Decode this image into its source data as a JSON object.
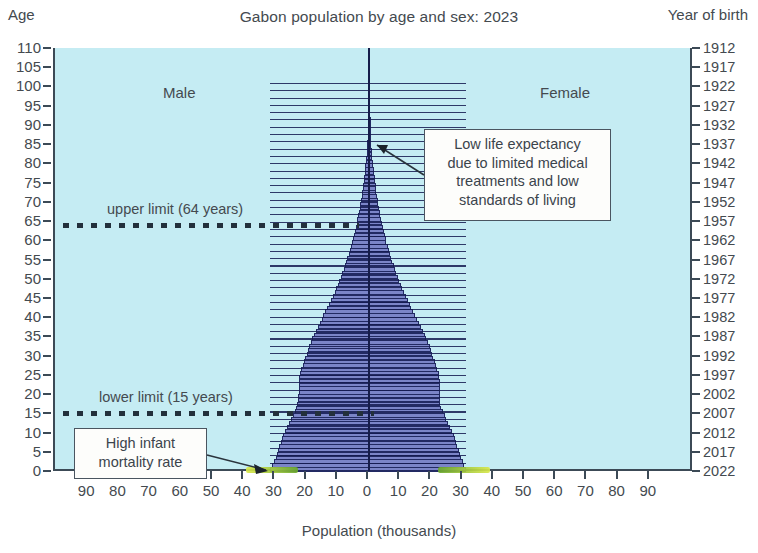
{
  "chart_data": {
    "type": "bar",
    "subtype": "population-pyramid",
    "title": "Gabon population by age and sex: 2023",
    "xlabel": "Population (thousands)",
    "ylabel": "Age",
    "ylabel_right": "Year of birth",
    "xlim": [
      -100,
      100
    ],
    "xtick_values": [
      -90,
      -80,
      -70,
      -60,
      -50,
      -40,
      -30,
      -20,
      -10,
      0,
      10,
      20,
      30,
      40,
      50,
      60,
      70,
      80,
      90
    ],
    "xtick_labels": [
      "90",
      "80",
      "70",
      "60",
      "50",
      "40",
      "30",
      "20",
      "10",
      "0",
      "10",
      "20",
      "30",
      "40",
      "50",
      "60",
      "70",
      "80",
      "90"
    ],
    "ylim": [
      0,
      110
    ],
    "ytick_labels": [
      "110",
      "105",
      "100",
      "95",
      "90",
      "85",
      "80",
      "75",
      "70",
      "65",
      "60",
      "55",
      "50",
      "45",
      "40",
      "35",
      "30",
      "25",
      "20",
      "15",
      "10",
      "5",
      "0"
    ],
    "year_of_birth_labels": [
      "1912",
      "1917",
      "1922",
      "1927",
      "1932",
      "1937",
      "1942",
      "1947",
      "1952",
      "1957",
      "1962",
      "1967",
      "1972",
      "1977",
      "1982",
      "1987",
      "1992",
      "1997",
      "2002",
      "2007",
      "2012",
      "2017",
      "2022"
    ],
    "grid": false,
    "legend": [
      "Male",
      "Female"
    ],
    "legend_position": "in-plot",
    "age_labels": [
      "0",
      "1",
      "2",
      "3",
      "4",
      "5",
      "6",
      "7",
      "8",
      "9",
      "10",
      "11",
      "12",
      "13",
      "14",
      "15",
      "16",
      "17",
      "18",
      "19",
      "20",
      "21",
      "22",
      "23",
      "24",
      "25",
      "26",
      "27",
      "28",
      "29",
      "30",
      "31",
      "32",
      "33",
      "34",
      "35",
      "36",
      "37",
      "38",
      "39",
      "40",
      "41",
      "42",
      "43",
      "44",
      "45",
      "46",
      "47",
      "48",
      "49",
      "50",
      "51",
      "52",
      "53",
      "54",
      "55",
      "56",
      "57",
      "58",
      "59",
      "60",
      "61",
      "62",
      "63",
      "64",
      "65",
      "66",
      "67",
      "68",
      "69",
      "70",
      "71",
      "72",
      "73",
      "74",
      "75",
      "76",
      "77",
      "78",
      "79",
      "80",
      "81",
      "82",
      "83",
      "84",
      "85",
      "86",
      "87",
      "88",
      "89",
      "90",
      "91",
      "92",
      "93",
      "94",
      "95",
      "96",
      "97",
      "98",
      "99",
      "100"
    ],
    "series": [
      {
        "name": "Male",
        "side": "left",
        "values": [
          31.8,
          31.0,
          30.4,
          29.9,
          29.5,
          29.1,
          28.7,
          28.3,
          27.9,
          27.5,
          27.0,
          26.3,
          25.6,
          25.0,
          24.4,
          23.8,
          23.4,
          23.0,
          22.8,
          22.6,
          22.5,
          22.5,
          22.5,
          22.5,
          22.4,
          22.2,
          21.8,
          21.3,
          20.8,
          20.4,
          20.0,
          19.6,
          19.2,
          18.7,
          18.2,
          17.6,
          17.0,
          16.4,
          15.8,
          15.2,
          14.6,
          14.0,
          13.4,
          12.8,
          12.2,
          11.6,
          11.0,
          10.5,
          10.0,
          9.5,
          9.0,
          8.5,
          8.1,
          7.7,
          7.3,
          6.9,
          6.5,
          6.1,
          5.8,
          5.4,
          5.1,
          4.8,
          4.5,
          4.2,
          3.9,
          3.7,
          3.4,
          3.2,
          3.0,
          2.8,
          2.6,
          2.4,
          2.2,
          2.0,
          1.9,
          1.7,
          1.6,
          1.4,
          1.3,
          1.2,
          1.0,
          0.9,
          0.8,
          0.7,
          0.6,
          0.5,
          0.4,
          0.35,
          0.3,
          0.25,
          0.2,
          0.16,
          0.13,
          0.1,
          0.08,
          0.06,
          0.05,
          0.04,
          0.03,
          0.02,
          0.02
        ]
      },
      {
        "name": "Female",
        "side": "right",
        "values": [
          31.2,
          30.5,
          30.0,
          29.5,
          29.1,
          28.7,
          28.3,
          27.9,
          27.5,
          27.1,
          26.6,
          26.0,
          25.4,
          24.8,
          24.2,
          23.6,
          23.2,
          22.9,
          22.7,
          22.6,
          22.6,
          22.6,
          22.6,
          22.6,
          22.5,
          22.3,
          21.9,
          21.4,
          21.0,
          20.6,
          20.2,
          19.8,
          19.4,
          18.9,
          18.4,
          17.8,
          17.2,
          16.6,
          16.0,
          15.4,
          14.8,
          14.2,
          13.6,
          13.0,
          12.4,
          11.8,
          11.2,
          10.7,
          10.2,
          9.7,
          9.2,
          8.7,
          8.3,
          7.9,
          7.5,
          7.1,
          6.7,
          6.3,
          6.0,
          5.6,
          5.3,
          5.0,
          4.7,
          4.4,
          4.1,
          3.9,
          3.6,
          3.4,
          3.2,
          3.0,
          2.8,
          2.6,
          2.4,
          2.2,
          2.1,
          1.9,
          1.8,
          1.6,
          1.5,
          1.4,
          1.2,
          1.1,
          1.0,
          0.9,
          0.8,
          0.7,
          0.55,
          0.45,
          0.38,
          0.3,
          0.25,
          0.2,
          0.16,
          0.13,
          0.1,
          0.08,
          0.06,
          0.05,
          0.04,
          0.03,
          0.02
        ]
      }
    ],
    "annotations": [
      {
        "id": "upper-limit",
        "label": "upper limit (64 years)",
        "age": 64,
        "style": "dotted-horizontal-line"
      },
      {
        "id": "lower-limit",
        "label": "lower limit (15 years)",
        "age": 15,
        "style": "dotted-horizontal-line"
      },
      {
        "id": "low-life-expectancy",
        "text": "Low life expectancy due to limited medical treatments and low standards of living",
        "lines": [
          "Low life expectancy",
          "due to limited medical",
          "treatments and low",
          "standards of living"
        ],
        "style": "callout-box-with-arrow",
        "points_to_age": 85
      },
      {
        "id": "high-infant-mortality",
        "text": "High infant mortality rate",
        "lines": [
          "High infant",
          "mortality rate"
        ],
        "style": "callout-box-with-arrow",
        "points_to_age": 0
      }
    ],
    "highlighter_marks": [
      {
        "id": "male-infant-highlight",
        "color": "#d9e84a",
        "age": 0,
        "side": "left"
      },
      {
        "id": "female-infant-highlight",
        "color": "#d9e84a",
        "age": 0,
        "side": "right"
      }
    ]
  },
  "colors": {
    "plot_background": "#c5ecf3",
    "bar_fill": "#7b85c8",
    "bar_outline": "#222a63",
    "axis": "#3c4a56",
    "text": "#444a4f",
    "highlighter": "#d9e84a",
    "highlighter_green": "#6aa82e",
    "callout_background": "#fdfdfb",
    "callout_border": "#4a5560"
  }
}
